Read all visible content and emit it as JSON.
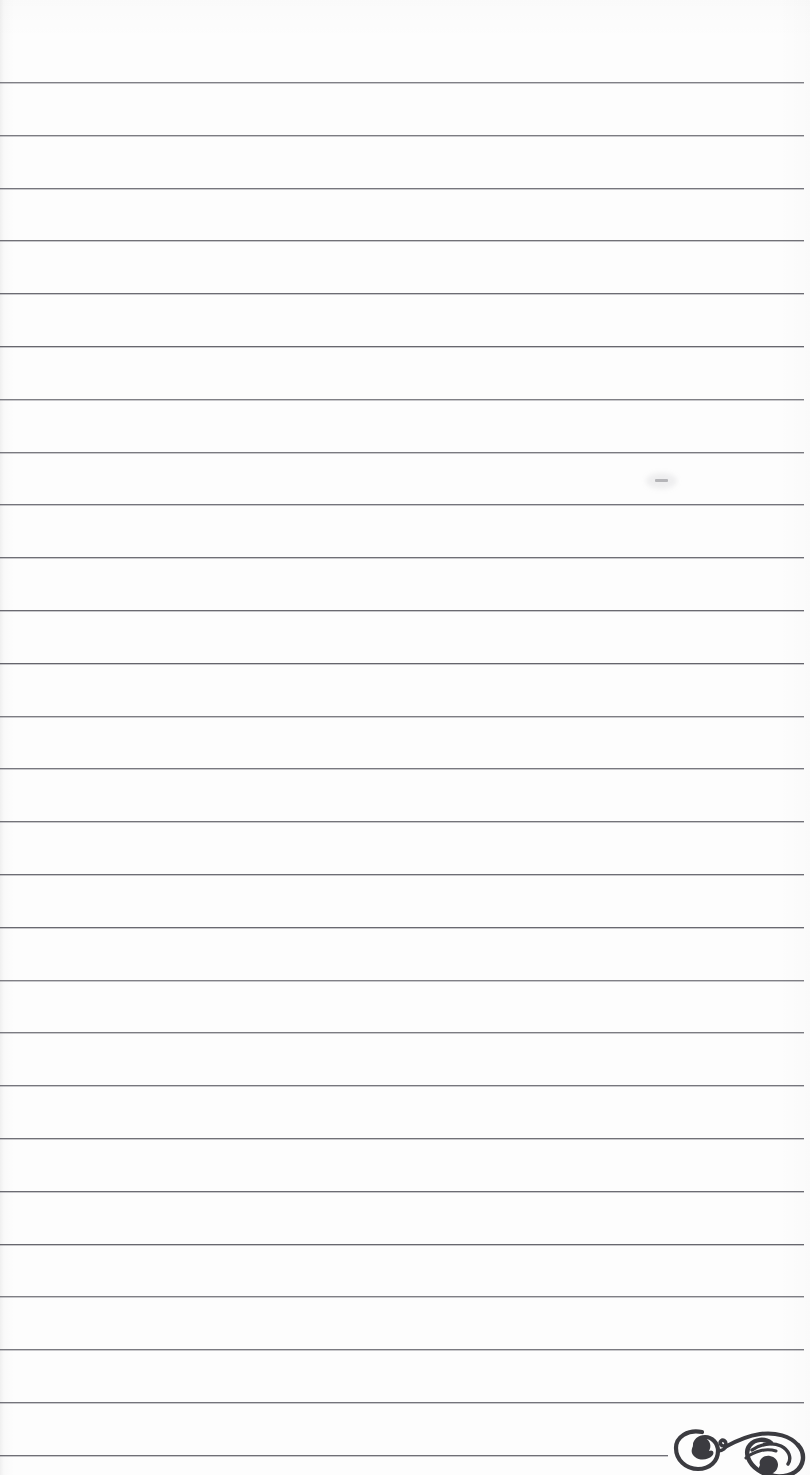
{
  "document": {
    "kind": "scanned-notebook-page",
    "title": "Blank ruled notebook page",
    "paper_color": "#fdfdfd",
    "rule_color": "#6d6d73",
    "ink_color": "#3b3b40",
    "width": 810,
    "height": 1475,
    "text_content": "",
    "page_number": "",
    "header": "",
    "footer": ""
  },
  "ruling": {
    "line_count": 27,
    "first_line_y": 82,
    "spacing": 52.7,
    "left_x": 0,
    "right_x": 804,
    "thickness": 1,
    "lines": [
      {
        "y": 82,
        "x1": 0,
        "x2": 804
      },
      {
        "y": 135,
        "x1": 0,
        "x2": 804
      },
      {
        "y": 188,
        "x1": 0,
        "x2": 804
      },
      {
        "y": 240,
        "x1": 0,
        "x2": 804
      },
      {
        "y": 293,
        "x1": 0,
        "x2": 804
      },
      {
        "y": 346,
        "x1": 0,
        "x2": 804
      },
      {
        "y": 399,
        "x1": 0,
        "x2": 804
      },
      {
        "y": 452,
        "x1": 0,
        "x2": 804
      },
      {
        "y": 504,
        "x1": 0,
        "x2": 804
      },
      {
        "y": 557,
        "x1": 0,
        "x2": 804
      },
      {
        "y": 610,
        "x1": 0,
        "x2": 804
      },
      {
        "y": 663,
        "x1": 0,
        "x2": 804
      },
      {
        "y": 716,
        "x1": 0,
        "x2": 804
      },
      {
        "y": 768,
        "x1": 0,
        "x2": 804
      },
      {
        "y": 821,
        "x1": 0,
        "x2": 804
      },
      {
        "y": 874,
        "x1": 0,
        "x2": 804
      },
      {
        "y": 927,
        "x1": 0,
        "x2": 804
      },
      {
        "y": 980,
        "x1": 0,
        "x2": 804
      },
      {
        "y": 1032,
        "x1": 0,
        "x2": 804
      },
      {
        "y": 1085,
        "x1": 0,
        "x2": 804
      },
      {
        "y": 1138,
        "x1": 0,
        "x2": 804
      },
      {
        "y": 1191,
        "x1": 0,
        "x2": 804
      },
      {
        "y": 1244,
        "x1": 0,
        "x2": 804
      },
      {
        "y": 1296,
        "x1": 0,
        "x2": 804
      },
      {
        "y": 1349,
        "x1": 0,
        "x2": 804
      },
      {
        "y": 1402,
        "x1": 0,
        "x2": 804
      },
      {
        "y": 1455,
        "x1": 0,
        "x2": 668
      }
    ]
  },
  "marks": {
    "smudge": {
      "label": "faint stray pencil dash",
      "x": 655,
      "y": 479,
      "width": 13,
      "height": 3
    },
    "doodle": {
      "label": "ornamental ink flourish, clipped by bottom page edge",
      "x": 668,
      "y": 1420,
      "width": 142,
      "height": 55
    }
  }
}
